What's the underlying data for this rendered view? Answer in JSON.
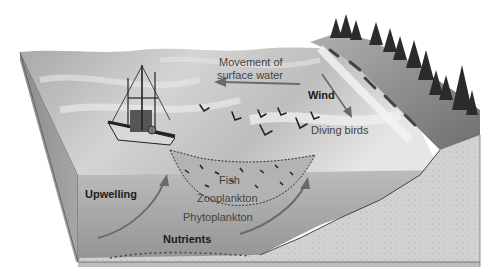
{
  "diagram": {
    "type": "block-diagram illustration",
    "colors": {
      "background": "#ffffff",
      "surface_water": "#c9c9c9",
      "deep_water": "#9e9e9e",
      "seafloor": "#cfcfcf",
      "cliff": "#8a8a8a",
      "trees": "#2b2b2b",
      "arrows": "#6a6a6a"
    },
    "labels": {
      "movement_line1": "Movement of",
      "movement_line2": "surface water",
      "wind": "Wind",
      "diving_birds": "Diving birds",
      "upwelling": "Upwelling",
      "fish": "Fish",
      "zooplankton": "Zooplankton",
      "phytoplankton": "Phytoplankton",
      "nutrients": "Nutrients"
    },
    "elements": [
      {
        "id": "fishing-boat",
        "kind": "illustration"
      },
      {
        "id": "fishing-net",
        "kind": "illustration"
      },
      {
        "id": "coastal-cliff",
        "kind": "illustration"
      },
      {
        "id": "conifer-trees",
        "kind": "illustration"
      },
      {
        "id": "diving-birds",
        "kind": "illustration",
        "count": 7
      },
      {
        "id": "surface-water-arrow",
        "kind": "arrow",
        "direction": "left"
      },
      {
        "id": "wind-arrow",
        "kind": "arrow",
        "direction": "down-right"
      },
      {
        "id": "upwelling-arrow-left",
        "kind": "arrow",
        "direction": "up-right"
      },
      {
        "id": "upwelling-arrow-right",
        "kind": "arrow",
        "direction": "up-right"
      }
    ]
  }
}
